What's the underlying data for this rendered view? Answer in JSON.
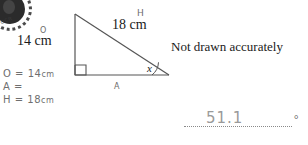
{
  "page": {
    "background_color": "#ffffff",
    "width": 308,
    "height": 145
  },
  "logo": {
    "name": "circular-stamp-logo",
    "caption": "OCR"
  },
  "figure": {
    "type": "right-triangle",
    "side_vertical_label": "14 cm",
    "hypotenuse_label": "18 cm",
    "angle_label": "x",
    "right_angle_marker": true,
    "stroke_color": "#555555"
  },
  "notice": {
    "text": "Not drawn accurately"
  },
  "annotations": {
    "opposite_marker": "O",
    "hypotenuse_marker": "H",
    "adjacent_marker": "A",
    "ink_color": "#6b6b6b",
    "lines": [
      {
        "label": "O",
        "equals": "=",
        "value": "14",
        "unit": "cm"
      },
      {
        "label": "A",
        "equals": "=",
        "value": "",
        "unit": ""
      },
      {
        "label": "H",
        "equals": "=",
        "value": "18",
        "unit": "cm"
      }
    ]
  },
  "answer": {
    "value": "51.1",
    "unit_symbol": "°"
  }
}
